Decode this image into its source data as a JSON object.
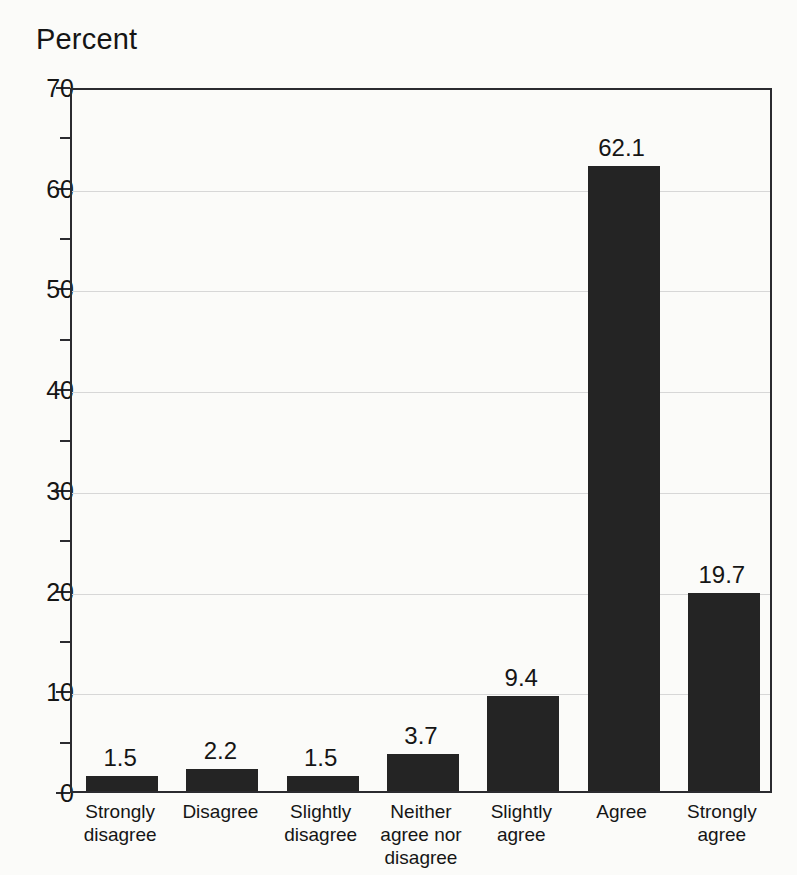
{
  "chart_data": {
    "type": "bar",
    "title": "Percent",
    "xlabel": "",
    "ylabel": "Percent",
    "ylim": [
      0,
      70
    ],
    "ytick_step": 10,
    "yminor_step": 5,
    "grid": true,
    "legend": null,
    "bar_color": "#242424",
    "categories": [
      "Strongly disagree",
      "Disagree",
      "Slightly disagree",
      "Neither agree nor disagree",
      "Slightly agree",
      "Agree",
      "Strongly agree"
    ],
    "category_lines": [
      [
        "Strongly",
        "disagree"
      ],
      [
        "Disagree"
      ],
      [
        "Slightly",
        "disagree"
      ],
      [
        "Neither",
        "agree nor",
        "disagree"
      ],
      [
        "Slightly",
        "agree"
      ],
      [
        "Agree"
      ],
      [
        "Strongly",
        "agree"
      ]
    ],
    "values": [
      1.5,
      2.2,
      1.5,
      3.7,
      9.4,
      62.1,
      19.7
    ],
    "value_labels": [
      "1.5",
      "2.2",
      "1.5",
      "3.7",
      "9.4",
      "62.1",
      "19.7"
    ],
    "ytick_labels": [
      "0",
      "10",
      "20",
      "30",
      "40",
      "50",
      "60",
      "70"
    ],
    "ytick_values": [
      0,
      10,
      20,
      30,
      40,
      50,
      60,
      70
    ],
    "yminor_values": [
      5,
      15,
      25,
      35,
      45,
      55,
      65
    ]
  }
}
